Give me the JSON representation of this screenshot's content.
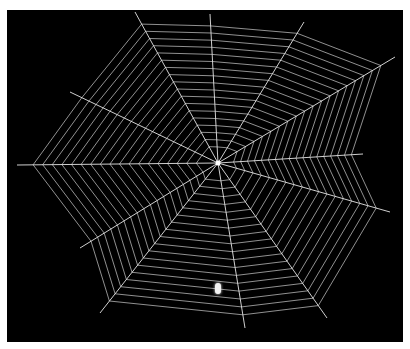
{
  "image": {
    "subject": "spider web with spider on black background",
    "background_color": "#000000",
    "border_color": "#ffffff",
    "silk_color": "#e6e6e6",
    "web_center": [
      218,
      163
    ],
    "spider_position": [
      218,
      289
    ],
    "radials": [
      [
        135,
        12
      ],
      [
        210,
        14
      ],
      [
        304,
        22
      ],
      [
        395,
        57
      ],
      [
        363,
        154
      ],
      [
        390,
        212
      ],
      [
        327,
        318
      ],
      [
        245,
        328
      ],
      [
        100,
        313
      ],
      [
        80,
        248
      ],
      [
        17,
        165
      ],
      [
        70,
        92
      ]
    ],
    "ring_count": 18
  }
}
